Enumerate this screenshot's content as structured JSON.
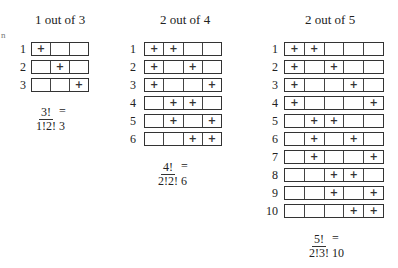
{
  "stray_mark": "n",
  "panels": [
    {
      "title": "1 out of 3",
      "k": 1,
      "n": 3,
      "rows": [
        {
          "label": "1",
          "cells": [
            "+",
            "",
            ""
          ]
        },
        {
          "label": "2",
          "cells": [
            "",
            "+",
            ""
          ]
        },
        {
          "label": "3",
          "cells": [
            "",
            "",
            "+"
          ]
        }
      ],
      "formula": {
        "numerator": "3!",
        "denominator": "1!2!",
        "result": "= 3"
      }
    },
    {
      "title": "2 out of 4",
      "k": 2,
      "n": 4,
      "rows": [
        {
          "label": "1",
          "cells": [
            "+",
            "+",
            "",
            ""
          ]
        },
        {
          "label": "2",
          "cells": [
            "+",
            "",
            "+",
            ""
          ]
        },
        {
          "label": "3",
          "cells": [
            "+",
            "",
            "",
            "+"
          ]
        },
        {
          "label": "4",
          "cells": [
            "",
            "+",
            "+",
            ""
          ]
        },
        {
          "label": "5",
          "cells": [
            "",
            "+",
            "",
            "+"
          ]
        },
        {
          "label": "6",
          "cells": [
            "",
            "",
            "+",
            "+"
          ]
        }
      ],
      "formula": {
        "numerator": "4!",
        "denominator": "2!2!",
        "result": "= 6"
      }
    },
    {
      "title": "2 out of 5",
      "k": 2,
      "n": 5,
      "rows": [
        {
          "label": "1",
          "cells": [
            "+",
            "+",
            "",
            "",
            ""
          ]
        },
        {
          "label": "2",
          "cells": [
            "+",
            "",
            "+",
            "",
            ""
          ]
        },
        {
          "label": "3",
          "cells": [
            "+",
            "",
            "",
            "+",
            ""
          ]
        },
        {
          "label": "4",
          "cells": [
            "+",
            "",
            "",
            "",
            "+"
          ]
        },
        {
          "label": "5",
          "cells": [
            "",
            "+",
            "+",
            "",
            ""
          ]
        },
        {
          "label": "6",
          "cells": [
            "",
            "+",
            "",
            "+",
            ""
          ]
        },
        {
          "label": "7",
          "cells": [
            "",
            "+",
            "",
            "",
            "+"
          ]
        },
        {
          "label": "8",
          "cells": [
            "",
            "",
            "+",
            "+",
            ""
          ]
        },
        {
          "label": "9",
          "cells": [
            "",
            "",
            "+",
            "",
            "+"
          ]
        },
        {
          "label": "10",
          "cells": [
            "",
            "",
            "",
            "+",
            "+"
          ]
        }
      ],
      "formula": {
        "numerator": "5!",
        "denominator": "2!3!",
        "result": "= 10"
      }
    }
  ]
}
